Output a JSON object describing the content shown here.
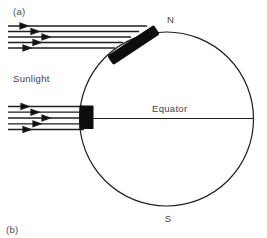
{
  "figure": {
    "panel_a_label": "(a)",
    "panel_b_label": "(b)",
    "sunlight_label": "Sunlight",
    "north_pole_label": "N",
    "south_pole_label": "S",
    "equator_label": "Equator"
  },
  "colors": {
    "ink": "#1f1f1f",
    "patch": "#0d0d0d",
    "text": "#3f3f3f",
    "background": "#ffffff"
  }
}
